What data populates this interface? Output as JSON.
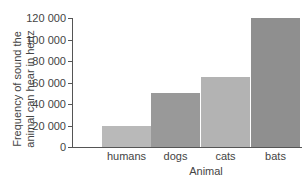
{
  "chart_data": {
    "type": "bar",
    "title": "",
    "xlabel": "Animal",
    "ylabel": "Frequency of sound the animal can hear in hertz",
    "ylabel_lines": [
      "Frequency of sound the",
      "animal can hear in hertz"
    ],
    "categories": [
      "humans",
      "dogs",
      "cats",
      "bats"
    ],
    "values": [
      20000,
      50000,
      65000,
      120000
    ],
    "bar_colors": [
      "#b9b9b9",
      "#999999",
      "#b3b3b3",
      "#8f8f8f"
    ],
    "ylim": [
      0,
      120000
    ],
    "yticks": [
      0,
      20000,
      40000,
      60000,
      80000,
      100000,
      120000
    ],
    "ytick_labels": [
      "0",
      "20 000",
      "40 000",
      "60 000",
      "80 000",
      "100 000",
      "120 000"
    ],
    "grid": false,
    "legend": null
  }
}
